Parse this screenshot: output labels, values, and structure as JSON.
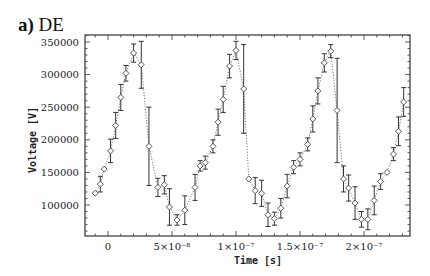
{
  "panel": {
    "letter": "a)",
    "name": "DE"
  },
  "chart_data": {
    "type": "scatter",
    "title": "a) DE",
    "xlabel": "Time [s]",
    "ylabel": "Voltage [V]",
    "xlim": [
      -1.8e-08,
      2.35e-07
    ],
    "ylim": [
      55000,
      362000
    ],
    "grid": false,
    "legend": null,
    "x_ticks": [
      {
        "value": 0,
        "label": "0"
      },
      {
        "value": 5e-08,
        "label": "5×10⁻⁸"
      },
      {
        "value": 1e-07,
        "label": "1×10⁻⁷"
      },
      {
        "value": 1.5e-07,
        "label": "1.5×10⁻⁷"
      },
      {
        "value": 2e-07,
        "label": "2×10⁻⁷"
      }
    ],
    "y_ticks": [
      {
        "value": 100000,
        "label": "100000"
      },
      {
        "value": 150000,
        "label": "150000"
      },
      {
        "value": 200000,
        "label": "200000"
      },
      {
        "value": 250000,
        "label": "250000"
      },
      {
        "value": 300000,
        "label": "300000"
      },
      {
        "value": 350000,
        "label": "350000"
      }
    ],
    "series": [
      {
        "name": "DE voltage",
        "marker": "open-diamond",
        "line": "dotted",
        "error_bars": true,
        "points": [
          {
            "t": -1e-08,
            "v": 118000,
            "err": 0
          },
          {
            "t": -6e-09,
            "v": 132000,
            "err": 12000
          },
          {
            "t": -3e-09,
            "v": 155000,
            "err": 0
          },
          {
            "t": 2e-09,
            "v": 183000,
            "err": 18000
          },
          {
            "t": 6e-09,
            "v": 222000,
            "err": 20000
          },
          {
            "t": 1e-08,
            "v": 265000,
            "err": 20000
          },
          {
            "t": 1.4e-08,
            "v": 302000,
            "err": 12000
          },
          {
            "t": 2e-08,
            "v": 333000,
            "err": 14000
          },
          {
            "t": 2.6e-08,
            "v": 315000,
            "err": 36000
          },
          {
            "t": 3.2e-08,
            "v": 190000,
            "err": 60000
          },
          {
            "t": 3.9e-08,
            "v": 127000,
            "err": 14000
          },
          {
            "t": 4.4e-08,
            "v": 131000,
            "err": 14000
          },
          {
            "t": 4.8e-08,
            "v": 97000,
            "err": 28000
          },
          {
            "t": 5.4e-08,
            "v": 77000,
            "err": 8000
          },
          {
            "t": 6e-08,
            "v": 92000,
            "err": 22000
          },
          {
            "t": 6.8e-08,
            "v": 127000,
            "err": 20000
          },
          {
            "t": 7.2e-08,
            "v": 160000,
            "err": 8000
          },
          {
            "t": 7.6e-08,
            "v": 165000,
            "err": 10000
          },
          {
            "t": 8.2e-08,
            "v": 190000,
            "err": 10000
          },
          {
            "t": 8.6e-08,
            "v": 227000,
            "err": 20000
          },
          {
            "t": 9e-08,
            "v": 262000,
            "err": 20000
          },
          {
            "t": 9.5e-08,
            "v": 313000,
            "err": 18000
          },
          {
            "t": 1e-07,
            "v": 337000,
            "err": 14000
          },
          {
            "t": 1.06e-07,
            "v": 278000,
            "err": 68000
          },
          {
            "t": 1.1e-07,
            "v": 140000,
            "err": 0
          },
          {
            "t": 1.15e-07,
            "v": 122000,
            "err": 20000
          },
          {
            "t": 1.2e-07,
            "v": 118000,
            "err": 20000
          },
          {
            "t": 1.25e-07,
            "v": 85000,
            "err": 18000
          },
          {
            "t": 1.3e-07,
            "v": 79000,
            "err": 10000
          },
          {
            "t": 1.35e-07,
            "v": 95000,
            "err": 15000
          },
          {
            "t": 1.4e-07,
            "v": 129000,
            "err": 18000
          },
          {
            "t": 1.45e-07,
            "v": 158000,
            "err": 10000
          },
          {
            "t": 1.5e-07,
            "v": 170000,
            "err": 10000
          },
          {
            "t": 1.56e-07,
            "v": 193000,
            "err": 10000
          },
          {
            "t": 1.6e-07,
            "v": 232000,
            "err": 20000
          },
          {
            "t": 1.64e-07,
            "v": 275000,
            "err": 20000
          },
          {
            "t": 1.69e-07,
            "v": 318000,
            "err": 14000
          },
          {
            "t": 1.74e-07,
            "v": 336000,
            "err": 10000
          },
          {
            "t": 1.79e-07,
            "v": 245000,
            "err": 80000
          },
          {
            "t": 1.84e-07,
            "v": 140000,
            "err": 20000
          },
          {
            "t": 1.88e-07,
            "v": 126000,
            "err": 20000
          },
          {
            "t": 1.93e-07,
            "v": 103000,
            "err": 25000
          },
          {
            "t": 1.98e-07,
            "v": 78000,
            "err": 12000
          },
          {
            "t": 2.03e-07,
            "v": 78000,
            "err": 16000
          },
          {
            "t": 2.08e-07,
            "v": 107000,
            "err": 22000
          },
          {
            "t": 2.13e-07,
            "v": 136000,
            "err": 12000
          },
          {
            "t": 2.18e-07,
            "v": 150000,
            "err": 0
          },
          {
            "t": 2.23e-07,
            "v": 178000,
            "err": 10000
          },
          {
            "t": 2.27e-07,
            "v": 213000,
            "err": 22000
          },
          {
            "t": 2.31e-07,
            "v": 258000,
            "err": 22000
          }
        ]
      }
    ]
  }
}
